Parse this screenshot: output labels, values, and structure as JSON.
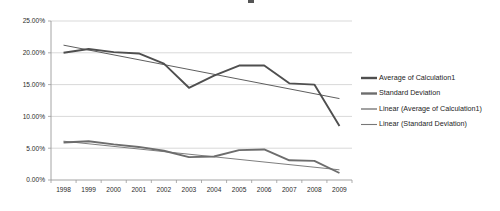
{
  "chart_data": {
    "type": "line",
    "title": "",
    "xlabel": "",
    "ylabel": "",
    "categories": [
      "1998",
      "1999",
      "2000",
      "2001",
      "2002",
      "2003",
      "2004",
      "2005",
      "2006",
      "2007",
      "2008",
      "2009"
    ],
    "ylim": [
      0,
      25
    ],
    "ytick_labels": [
      "0.00%",
      "5.00%",
      "10.00%",
      "15.00%",
      "20.00%",
      "25.00%"
    ],
    "ytick_values": [
      0,
      5,
      10,
      15,
      20,
      25
    ],
    "grid": true,
    "legend_position": "right",
    "series": [
      {
        "name": "Average of Calculation1",
        "kind": "data",
        "color": "#4f4f4f",
        "values": [
          20.0,
          20.6,
          20.1,
          19.9,
          18.3,
          14.5,
          16.4,
          18.0,
          18.0,
          15.2,
          15.0,
          8.5
        ]
      },
      {
        "name": "Standard Deviation",
        "kind": "data",
        "color": "#6d6d6d",
        "values": [
          5.9,
          6.1,
          5.6,
          5.2,
          4.6,
          3.6,
          3.7,
          4.7,
          4.8,
          3.1,
          3.0,
          1.1
        ]
      },
      {
        "name": "Linear (Average of Calculation1)",
        "kind": "trendline",
        "color": "#555555",
        "endpoints": [
          21.2,
          12.8
        ]
      },
      {
        "name": "Linear (Standard Deviation)",
        "kind": "trendline",
        "color": "#777777",
        "endpoints": [
          6.1,
          1.6
        ]
      }
    ]
  },
  "legend": {
    "items": [
      {
        "label": "Average of Calculation1"
      },
      {
        "label": "Standard Deviation"
      },
      {
        "label": "Linear (Average of Calculation1)"
      },
      {
        "label": "Linear (Standard Deviation)"
      }
    ]
  }
}
